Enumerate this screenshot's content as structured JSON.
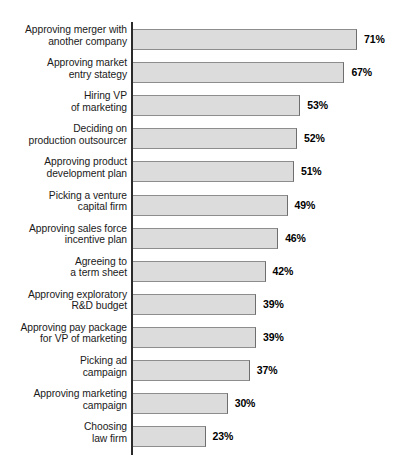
{
  "chart_data": {
    "type": "bar",
    "orientation": "horizontal",
    "title": "",
    "subtitle": "",
    "xlabel": "",
    "ylabel": "",
    "grid": false,
    "legend": "none",
    "axis_ranges": {
      "x": [
        0,
        75
      ],
      "value_suffix": "%"
    },
    "categories": [
      "Approving merger with\nanother company",
      "Approving market\nentry stategy",
      "Hiring VP\nof marketing",
      "Deciding on\nproduction outsourcer",
      "Approving product\ndevelopment plan",
      "Picking a venture\ncapital firm",
      "Approving sales force\nincentive plan",
      "Agreeing to\na term sheet",
      "Approving exploratory\nR&D budget",
      "Approving pay package\nfor VP of marketing",
      "Picking ad\ncampaign",
      "Approving marketing\ncampaign",
      "Choosing\nlaw firm"
    ],
    "values": [
      71,
      67,
      53,
      52,
      51,
      49,
      46,
      42,
      39,
      39,
      37,
      30,
      23
    ],
    "value_labels": [
      "71%",
      "67%",
      "53%",
      "52%",
      "51%",
      "49%",
      "46%",
      "42%",
      "39%",
      "39%",
      "37%",
      "30%",
      "23%"
    ],
    "colors": {
      "bar_fill": "#dcdcdc",
      "bar_edge": "#8d8d8d",
      "axis": "#2b2b2b",
      "label_text": "#1a1a1a",
      "value_text": "#000000",
      "background": "#ffffff"
    }
  }
}
